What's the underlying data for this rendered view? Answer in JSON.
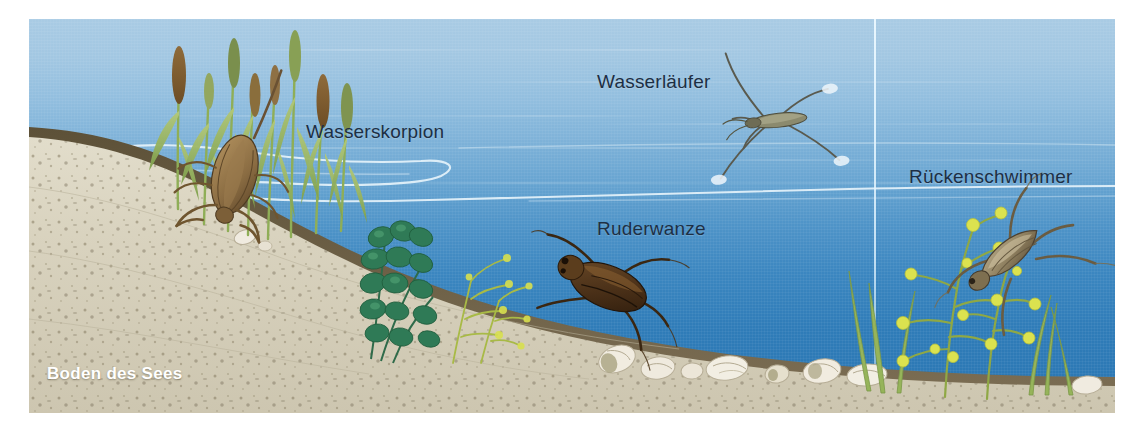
{
  "figure": {
    "background_color": "#ffffff",
    "water_top_color": "#a9cbe4",
    "water_bottom_color": "#2a76b2",
    "sand_color": "#d8d2bd",
    "sediment_color": "#6e6049",
    "label_color": "#1d2f44",
    "bottom_label_color": "#ffffff"
  },
  "labels": [
    {
      "id": "wasserskorpion",
      "text": "Wasserskorpion",
      "x": 306,
      "y": 112
    },
    {
      "id": "wasserlaeufer",
      "text": "Wasserläufer",
      "x": 597,
      "y": 62
    },
    {
      "id": "ruderwanze",
      "text": "Ruderwanze",
      "x": 597,
      "y": 209
    },
    {
      "id": "rueckenschwimmer",
      "text": "Rückenschwimmer",
      "x": 909,
      "y": 157
    }
  ],
  "bottom_label": {
    "id": "boden-des-sees",
    "text": "Boden des Sees",
    "x": 47,
    "y": 364
  },
  "organisms": [
    {
      "id": "wasserskorpion",
      "name": "Wasserskorpion",
      "habitat": "unter Wasser, an Pflanzenstängeln"
    },
    {
      "id": "wasserlaeufer",
      "name": "Wasserläufer",
      "habitat": "auf der Wasseroberfläche"
    },
    {
      "id": "ruderwanze",
      "name": "Ruderwanze",
      "habitat": "freies Wasser"
    },
    {
      "id": "rueckenschwimmer",
      "name": "Rückenschwimmer",
      "habitat": "freies Wasser, zwischen Wasserpflanzen"
    }
  ],
  "scene_elements": [
    {
      "id": "reeds",
      "name": "Schilfrohr"
    },
    {
      "id": "sand-slope",
      "name": "Sandufer"
    },
    {
      "id": "snail-shells",
      "name": "Schneckenhäuser"
    },
    {
      "id": "water-plants-left",
      "name": "Wasserpflanzen"
    },
    {
      "id": "water-plants-right",
      "name": "Wasserpflanzen"
    },
    {
      "id": "surface-line",
      "name": "Wasseroberfläche"
    }
  ]
}
